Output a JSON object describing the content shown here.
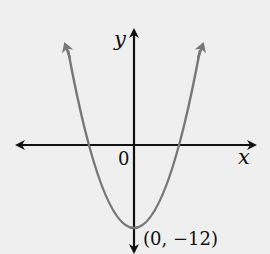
{
  "figure": {
    "type": "parabola-graph",
    "axes": {
      "x_label": "x",
      "y_label": "y",
      "origin_label": "0"
    },
    "curve": {
      "description": "upward-opening parabola",
      "vertex_label": "(0, −12)",
      "vertex": [
        0,
        -12
      ],
      "color": "#777777"
    },
    "axis_color": "#111111",
    "background": "#efefef"
  }
}
